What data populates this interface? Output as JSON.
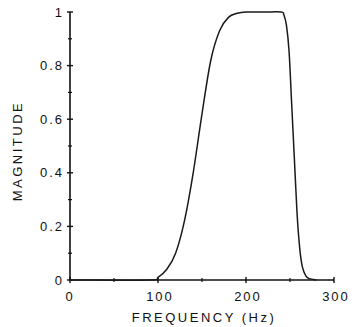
{
  "chart_data": {
    "type": "line",
    "title": "",
    "xlabel": "FREQUENCY (Hz)",
    "ylabel": "MAGNITUDE",
    "xlim": [
      0,
      300
    ],
    "ylim": [
      0,
      1
    ],
    "grid": false,
    "legend": null,
    "x_ticks": [
      0,
      100,
      200,
      300
    ],
    "x_tick_labels": [
      "0",
      "100",
      "200",
      "300"
    ],
    "x_minor_ticks": [
      50,
      150,
      250
    ],
    "y_ticks": [
      0,
      0.2,
      0.4,
      0.6,
      0.8,
      1
    ],
    "y_tick_labels": [
      "0",
      "0.2",
      "0.4",
      "0.6",
      "0.8",
      "1"
    ],
    "y_minor_ticks": [
      0.1,
      0.3,
      0.5,
      0.7,
      0.9
    ],
    "series": [
      {
        "name": "magnitude response",
        "x": [
          0,
          90,
          100,
          110,
          120,
          130,
          140,
          150,
          160,
          170,
          180,
          190,
          200,
          220,
          240,
          243,
          246,
          249,
          252,
          255,
          258,
          261,
          264,
          268,
          272,
          280
        ],
        "y": [
          0,
          0,
          0.01,
          0.04,
          0.1,
          0.22,
          0.4,
          0.62,
          0.82,
          0.93,
          0.98,
          0.995,
          1.0,
          1.0,
          1.0,
          0.99,
          0.95,
          0.85,
          0.65,
          0.45,
          0.25,
          0.12,
          0.05,
          0.015,
          0.005,
          0
        ]
      }
    ]
  }
}
